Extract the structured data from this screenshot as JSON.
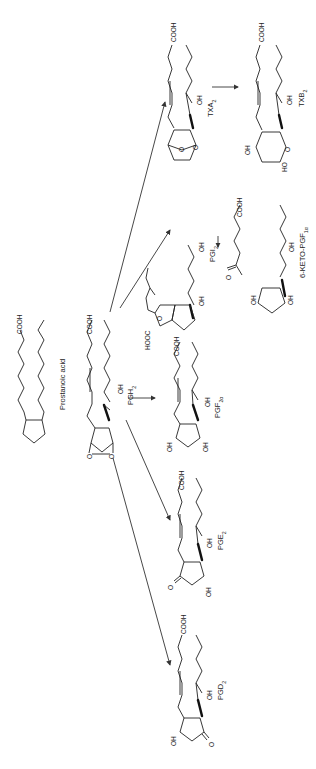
{
  "figure": {
    "orientation": "rotated 90 degrees counter-clockwise",
    "precursor": {
      "name": "Prostanoic acid",
      "group": "COOH",
      "carbon_numbers": [
        "1",
        "2",
        "3",
        "4",
        "5",
        "6",
        "7",
        "8",
        "9",
        "10",
        "11",
        "12",
        "13",
        "14",
        "15",
        "16",
        "17",
        "18",
        "19",
        "20"
      ]
    },
    "intermediate": {
      "name": "PGH",
      "sub": "2",
      "groups": [
        "COOH",
        "OH"
      ]
    },
    "products": [
      {
        "id": "pgd2",
        "name": "PGD",
        "sub": "2",
        "groups": [
          "COOH",
          "OH",
          "HO",
          "O"
        ]
      },
      {
        "id": "pge2",
        "name": "PGE",
        "sub": "2",
        "groups": [
          "COOH",
          "OH",
          "O",
          "OH"
        ]
      },
      {
        "id": "pgf2a",
        "name": "PGF",
        "sub": "2α",
        "groups": [
          "COOH",
          "OH",
          "OH",
          "OH"
        ]
      },
      {
        "id": "pgi2",
        "name": "PGI",
        "sub": "2",
        "groups": [
          "HOOC",
          "OH",
          "O",
          "OH"
        ]
      },
      {
        "id": "txa2",
        "name": "TXA",
        "sub": "2",
        "groups": [
          "COOH",
          "OH",
          "O",
          "O"
        ]
      }
    ],
    "metabolites": [
      {
        "id": "keto-pgf1a",
        "name": "6-KETO-PGF",
        "sub": "1α",
        "from": "pgi2",
        "groups": [
          "COOH",
          "O",
          "OH",
          "OH",
          "OH"
        ]
      },
      {
        "id": "txb2",
        "name": "TXB",
        "sub": "2",
        "from": "txa2",
        "groups": [
          "COOH",
          "OH",
          "OH",
          "HO"
        ]
      }
    ],
    "arrows": [
      {
        "from": "PGH2",
        "to": "PGD2"
      },
      {
        "from": "PGH2",
        "to": "PGE2"
      },
      {
        "from": "PGH2",
        "to": "PGF2α"
      },
      {
        "from": "PGH2",
        "to": "PGI2"
      },
      {
        "from": "PGH2",
        "to": "TXA2"
      },
      {
        "from": "PGI2",
        "to": "6-KETO-PGF1α"
      },
      {
        "from": "TXA2",
        "to": "TXB2"
      }
    ],
    "labels": {
      "cooh": "COOH",
      "hooc": "HOOC",
      "oh": "OH",
      "ho": "HO",
      "o": "O"
    },
    "colors": {
      "ink": "#222222",
      "background": "#ffffff"
    }
  }
}
